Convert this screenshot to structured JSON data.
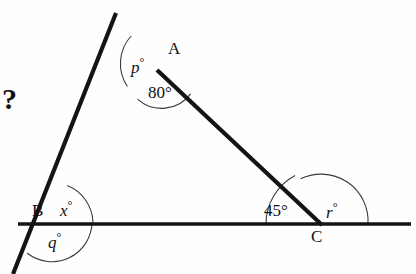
{
  "figure": {
    "type": "geometry-diagram",
    "stroke_color": "#141414",
    "arc_color": "#3a3a3a",
    "background": "#fefefe",
    "prompt_symbol": "?",
    "vertices": [
      {
        "name": "A",
        "label": "A",
        "x": 157,
        "y": 70,
        "label_x": 168,
        "label_y": 40
      },
      {
        "name": "B",
        "label": "B",
        "x": 52,
        "y": 222,
        "label_x": 32,
        "label_y": 202
      },
      {
        "name": "C",
        "label": "C",
        "x": 321,
        "y": 224,
        "label_x": 311,
        "label_y": 228
      }
    ],
    "segments": [
      {
        "name": "line-through-A-and-B",
        "x1": 116,
        "y1": 13,
        "x2": 13,
        "y2": 274
      },
      {
        "name": "line-A-to-C",
        "x1": 157,
        "y1": 70,
        "x2": 321,
        "y2": 224
      },
      {
        "name": "horizontal-base-line",
        "x1": 18,
        "y1": 224,
        "x2": 411,
        "y2": 224
      }
    ],
    "angles": [
      {
        "name": "angle-p",
        "label": "p",
        "degree_symbol": "°",
        "value": null,
        "vertex": "A",
        "kind": "variable",
        "label_x": 131,
        "label_y": 56
      },
      {
        "name": "angle-80",
        "label": "80°",
        "value": 80,
        "vertex": "A",
        "kind": "known",
        "label_x": 148,
        "label_y": 84
      },
      {
        "name": "angle-x",
        "label": "x",
        "degree_symbol": "°",
        "value": null,
        "vertex": "B",
        "kind": "variable",
        "label_x": 60,
        "label_y": 199
      },
      {
        "name": "angle-q",
        "label": "q",
        "degree_symbol": "°",
        "value": null,
        "vertex": "B",
        "kind": "variable",
        "label_x": 48,
        "label_y": 231
      },
      {
        "name": "angle-45",
        "label": "45°",
        "value": 45,
        "vertex": "C",
        "kind": "known",
        "label_x": 264,
        "label_y": 202
      },
      {
        "name": "angle-r",
        "label": "r",
        "degree_symbol": "°",
        "value": null,
        "vertex": "C",
        "kind": "variable",
        "label_x": 326,
        "label_y": 201
      }
    ]
  }
}
